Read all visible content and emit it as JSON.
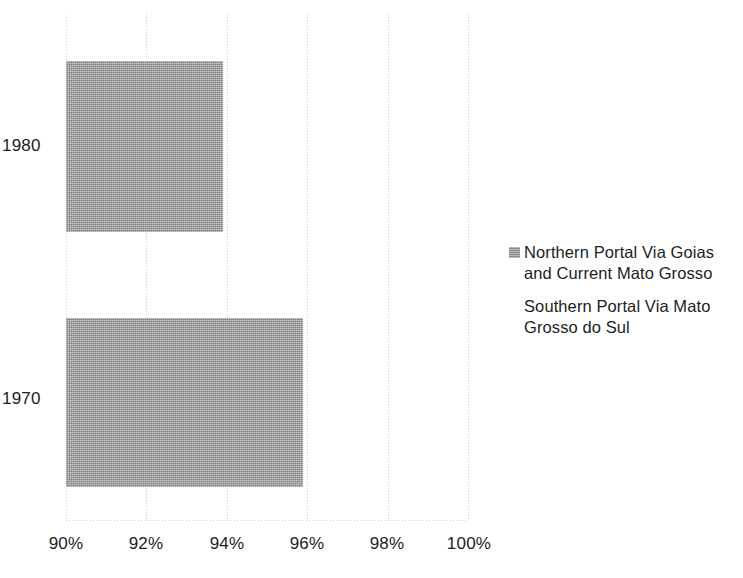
{
  "chart_data": {
    "type": "bar",
    "orientation": "horizontal",
    "title": "",
    "xlabel": "",
    "ylabel": "",
    "categories": [
      "1980",
      "1970"
    ],
    "series": [
      {
        "name": "Northern Portal Via Goias and Current Mato Grosso",
        "values": [
          93.9,
          95.9
        ],
        "color": "#9b9b9b"
      },
      {
        "name": "Southern Portal Via Mato Grosso do Sul",
        "values": [
          0,
          0
        ],
        "color": "#ffffff"
      }
    ],
    "xlim": [
      90,
      100
    ],
    "xticks": [
      "90%",
      "92%",
      "94%",
      "96%",
      "98%",
      "100%"
    ],
    "xtick_values": [
      90,
      92,
      94,
      96,
      98,
      100
    ],
    "grid": "vertical-dotted",
    "legend_position": "right"
  },
  "legend": {
    "entries": [
      {
        "label_line1": "Northern Portal Via Goias",
        "label_line2": "and Current Mato Grosso"
      },
      {
        "label_line1": "Southern Portal Via Mato",
        "label_line2": "Grosso do Sul"
      }
    ]
  },
  "axis": {
    "category_labels": [
      "1980",
      "1970"
    ],
    "tick_labels": [
      "90%",
      "92%",
      "94%",
      "96%",
      "98%",
      "100%"
    ]
  }
}
